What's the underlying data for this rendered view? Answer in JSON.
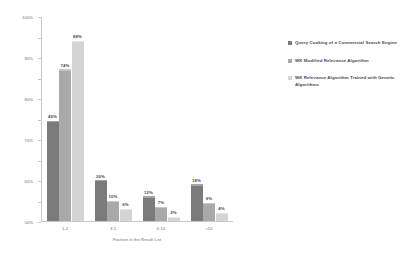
{
  "chart_data": {
    "type": "bar",
    "title": "",
    "xlabel": "Position in the Result List",
    "ylabel": "",
    "categories": [
      "1-2",
      "3-5",
      "6-10",
      ">10"
    ],
    "series": [
      {
        "name": "Query Cooking of a Commercial Search Engine",
        "color": "#7b7b7b",
        "values": [
          49,
          20,
          12,
          18
        ],
        "labels": [
          "49%",
          "20%",
          "12%",
          "18%"
        ]
      },
      {
        "name": "WK Modified Relevance Algorithm",
        "color": "#a9a9a9",
        "values": [
          74,
          10,
          7,
          9
        ],
        "labels": [
          "74%",
          "10%",
          "7%",
          "9%"
        ]
      },
      {
        "name": "WK Relevance Algorithm Trained with Genetic Algorithms",
        "color": "#d4d4d4",
        "values": [
          88,
          6,
          2,
          4
        ],
        "labels": [
          "88%",
          "6%",
          "2%",
          "4%"
        ]
      }
    ],
    "ylim": [
      0,
      100
    ],
    "ytick_labels": [
      "100%",
      "90%",
      "80%",
      "70%",
      "60%",
      "50%",
      "40%",
      "30%",
      "20%",
      "10%",
      "0%"
    ],
    "ytick_values": [
      100,
      90,
      80,
      70,
      60,
      50,
      40,
      30,
      20,
      10,
      0
    ],
    "grid": false,
    "legend_position": "right"
  }
}
